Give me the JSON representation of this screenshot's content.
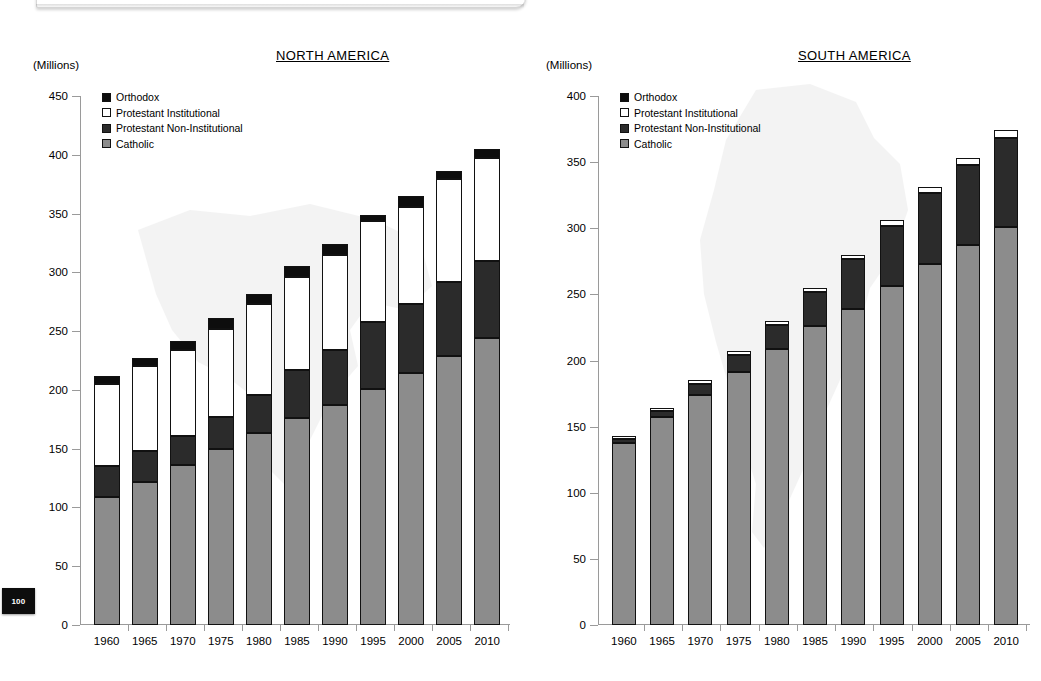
{
  "page": {
    "page_number": "100"
  },
  "units_label": "(Millions)",
  "legend_items": [
    {
      "key": "orthodox",
      "label": "Orthodox",
      "color": "#0d0d0d"
    },
    {
      "key": "protestant_institutional",
      "label": "Protestant Institutional",
      "color": "#ffffff"
    },
    {
      "key": "protestant_non_institutional",
      "label": "Protestant Non-Institutional",
      "color": "#2b2b2b"
    },
    {
      "key": "catholic",
      "label": "Catholic",
      "color": "#8c8c8c"
    }
  ],
  "chart_data": [
    {
      "id": "north-america",
      "type": "bar",
      "stacked": true,
      "title": "NORTH AMERICA",
      "xlabel": "",
      "ylabel": "(Millions)",
      "ylim": [
        0,
        450
      ],
      "ytick_step": 50,
      "yticks": [
        0,
        50,
        100,
        150,
        200,
        250,
        300,
        350,
        400,
        450
      ],
      "grid": false,
      "legend_position": "top-left",
      "categories": [
        "1960",
        "1965",
        "1970",
        "1975",
        "1980",
        "1985",
        "1990",
        "1995",
        "2000",
        "2005",
        "2010"
      ],
      "series": [
        {
          "name": "Catholic",
          "color": "#8c8c8c",
          "values": [
            109,
            122,
            136,
            150,
            163,
            176,
            187,
            201,
            214,
            229,
            244
          ]
        },
        {
          "name": "Protestant Non-Institutional",
          "color": "#2b2b2b",
          "values": [
            26,
            26,
            25,
            27,
            33,
            41,
            47,
            57,
            59,
            63,
            66
          ]
        },
        {
          "name": "Protestant Institutional",
          "color": "#ffffff",
          "values": [
            70,
            72,
            73,
            75,
            77,
            79,
            81,
            86,
            83,
            87,
            87
          ]
        },
        {
          "name": "Orthodox",
          "color": "#0d0d0d",
          "values": [
            7,
            7,
            8,
            9,
            9,
            9,
            9,
            5,
            9,
            7,
            8
          ]
        }
      ],
      "totals": [
        212,
        227,
        242,
        261,
        282,
        305,
        324,
        349,
        365,
        386,
        405
      ]
    },
    {
      "id": "south-america",
      "type": "bar",
      "stacked": true,
      "title": "SOUTH AMERICA",
      "xlabel": "",
      "ylabel": "(Millions)",
      "ylim": [
        0,
        400
      ],
      "ytick_step": 50,
      "yticks": [
        0,
        50,
        100,
        150,
        200,
        250,
        300,
        350,
        400
      ],
      "grid": false,
      "legend_position": "top-left",
      "categories": [
        "1960",
        "1965",
        "1970",
        "1975",
        "1980",
        "1985",
        "1990",
        "1995",
        "2000",
        "2005",
        "2010"
      ],
      "series": [
        {
          "name": "Catholic",
          "color": "#8c8c8c",
          "values": [
            138,
            157,
            174,
            191,
            209,
            226,
            239,
            256,
            273,
            287,
            301
          ]
        },
        {
          "name": "Protestant Non-Institutional",
          "color": "#2b2b2b",
          "values": [
            3,
            5,
            8,
            13,
            18,
            26,
            38,
            46,
            54,
            61,
            67
          ]
        },
        {
          "name": "Protestant Institutional",
          "color": "#ffffff",
          "values": [
            2,
            2,
            3,
            3,
            3,
            3,
            3,
            4,
            4,
            5,
            6
          ]
        },
        {
          "name": "Orthodox",
          "color": "#0d0d0d",
          "values": [
            0,
            0,
            0,
            0,
            0,
            0,
            0,
            0,
            0,
            0,
            0
          ]
        }
      ],
      "totals": [
        143,
        164,
        185,
        207,
        230,
        255,
        280,
        306,
        331,
        353,
        374
      ]
    }
  ]
}
